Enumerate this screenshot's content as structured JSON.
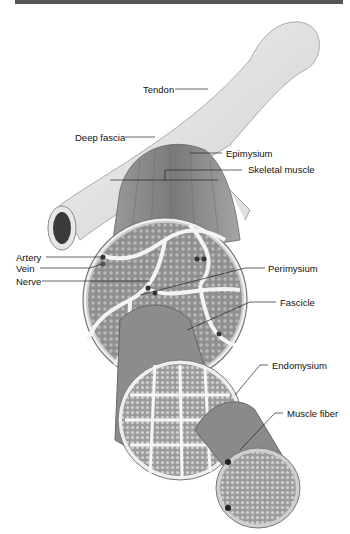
{
  "figure": {
    "colors": {
      "bar": "#555555",
      "bone": "#e6e6e6",
      "muscle": "#8a8a8a",
      "fascicle": "#9a9a9a",
      "line": "#222222"
    },
    "labels": {
      "tendon": "Tendon",
      "deep_fascia": "Deep fascia",
      "epimysium": "Epimysium",
      "skeletal_muscle": "Skeletal muscle",
      "artery": "Artery",
      "vein": "Vein",
      "nerve": "Nerve",
      "perimysium": "Perimysium",
      "fascicle": "Fascicle",
      "endomysium": "Endomysium",
      "muscle_fiber": "Muscle fiber"
    }
  }
}
